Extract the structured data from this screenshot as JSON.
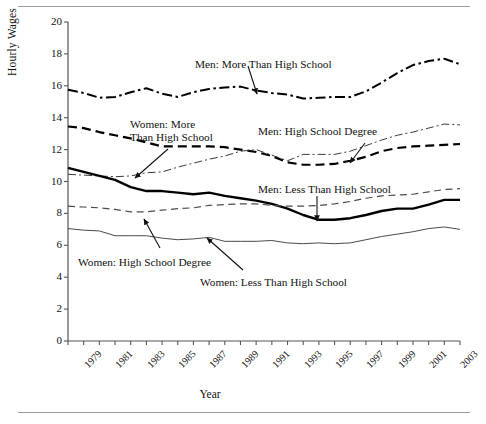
{
  "axes": {
    "ylabel": "Hourly Wages",
    "xlabel": "Year",
    "y_ticks": [
      "20",
      "18",
      "16",
      "14",
      "12",
      "10",
      "8",
      "6",
      "4",
      "2",
      "0"
    ],
    "x_ticks": [
      "1979",
      "1981",
      "1983",
      "1985",
      "1987",
      "1989",
      "1991",
      "1993",
      "1995",
      "1997",
      "1999",
      "2001",
      "2003"
    ]
  },
  "annotations": [
    {
      "id": "men-more-than-high-school",
      "lines": [
        "Men: More Than High School"
      ]
    },
    {
      "id": "women-more-than-high-school",
      "lines": [
        "Women: More",
        "Than High School"
      ]
    },
    {
      "id": "men-high-school-degree",
      "lines": [
        "Men: High School Degree"
      ]
    },
    {
      "id": "men-less-than-high-school",
      "lines": [
        "Men: Less Than High School"
      ]
    },
    {
      "id": "women-high-school-degree",
      "lines": [
        "Women: High School Degree"
      ]
    },
    {
      "id": "women-less-than-high-school",
      "lines": [
        "Women: Less Than High School"
      ]
    }
  ],
  "chart_data": {
    "type": "line",
    "title": "",
    "xlabel": "Year",
    "ylabel": "Hourly Wages",
    "xlim": [
      1979,
      2004
    ],
    "ylim": [
      0,
      20
    ],
    "ytick_step": 2,
    "grid": false,
    "legend": "annotations-on-plot",
    "x": [
      1979,
      1980,
      1981,
      1982,
      1983,
      1984,
      1985,
      1986,
      1987,
      1988,
      1989,
      1990,
      1991,
      1992,
      1993,
      1994,
      1995,
      1996,
      1997,
      1998,
      1999,
      2000,
      2001,
      2002,
      2003,
      2004
    ],
    "series": [
      {
        "name": "Men: More Than High School",
        "style": "dash-dot",
        "width": 2.0,
        "color": "#000000",
        "values": [
          15.75,
          15.55,
          15.25,
          15.3,
          15.6,
          15.85,
          15.5,
          15.3,
          15.6,
          15.8,
          15.9,
          15.95,
          15.7,
          15.55,
          15.45,
          15.2,
          15.25,
          15.3,
          15.3,
          15.65,
          16.2,
          16.8,
          17.3,
          17.55,
          17.7,
          17.35
        ]
      },
      {
        "name": "Women: More Than High School",
        "style": "dashed",
        "width": 2.2,
        "color": "#000000",
        "values": [
          13.45,
          13.35,
          13.1,
          12.9,
          12.7,
          12.45,
          12.2,
          12.2,
          12.2,
          12.2,
          12.15,
          12.0,
          11.85,
          11.6,
          11.2,
          11.05,
          11.05,
          11.1,
          11.3,
          11.55,
          11.9,
          12.1,
          12.2,
          12.25,
          12.3,
          12.35
        ]
      },
      {
        "name": "Men: High School Degree",
        "style": "dash-dot-thin",
        "width": 1.0,
        "color": "#3a3a3a",
        "values": [
          10.45,
          10.4,
          10.35,
          10.3,
          10.35,
          10.55,
          10.6,
          10.9,
          11.15,
          11.4,
          11.6,
          11.9,
          12.0,
          11.65,
          11.3,
          11.7,
          11.7,
          11.7,
          11.9,
          12.25,
          12.6,
          12.9,
          13.1,
          13.35,
          13.6,
          13.55
        ]
      },
      {
        "name": "Men: Less Than High School",
        "style": "solid",
        "width": 2.4,
        "color": "#000000",
        "values": [
          10.85,
          10.6,
          10.35,
          10.1,
          9.65,
          9.4,
          9.4,
          9.3,
          9.2,
          9.3,
          9.1,
          8.95,
          8.8,
          8.6,
          8.3,
          7.9,
          7.6,
          7.6,
          7.7,
          7.9,
          8.15,
          8.3,
          8.3,
          8.55,
          8.85,
          8.85
        ]
      },
      {
        "name": "Women: High School Degree",
        "style": "dashed-thin",
        "width": 1.2,
        "color": "#4a4a4a",
        "values": [
          8.45,
          8.4,
          8.35,
          8.25,
          8.1,
          8.1,
          8.2,
          8.3,
          8.35,
          8.5,
          8.55,
          8.6,
          8.6,
          8.5,
          8.45,
          8.45,
          8.5,
          8.6,
          8.75,
          8.95,
          9.1,
          9.15,
          9.2,
          9.35,
          9.5,
          9.55
        ]
      },
      {
        "name": "Women: Less Than High School",
        "style": "solid-thin",
        "width": 1.0,
        "color": "#4a4a4a",
        "values": [
          7.05,
          6.95,
          6.9,
          6.6,
          6.6,
          6.6,
          6.45,
          6.35,
          6.4,
          6.5,
          6.25,
          6.25,
          6.25,
          6.3,
          6.15,
          6.1,
          6.15,
          6.1,
          6.15,
          6.35,
          6.55,
          6.7,
          6.85,
          7.05,
          7.15,
          7.0
        ]
      }
    ]
  },
  "pointers": [
    {
      "for": "Men: More Than High School",
      "from": [
        248,
        66
      ],
      "to": [
        257,
        94
      ]
    },
    {
      "for": "Women: More Than High School",
      "from": [
        168,
        149
      ],
      "to": [
        135,
        178
      ]
    },
    {
      "for": "Men: High School Degree",
      "from": [
        365,
        143
      ],
      "to": [
        350,
        163
      ]
    },
    {
      "for": "Men: Less Than High School",
      "from": [
        317,
        196
      ],
      "to": [
        317,
        221
      ]
    },
    {
      "for": "Women: High School Degree",
      "from": [
        160,
        248
      ],
      "to": [
        144,
        219
      ]
    },
    {
      "for": "Women: Less Than High School",
      "from": [
        243,
        270
      ],
      "to": [
        207,
        238
      ]
    }
  ]
}
